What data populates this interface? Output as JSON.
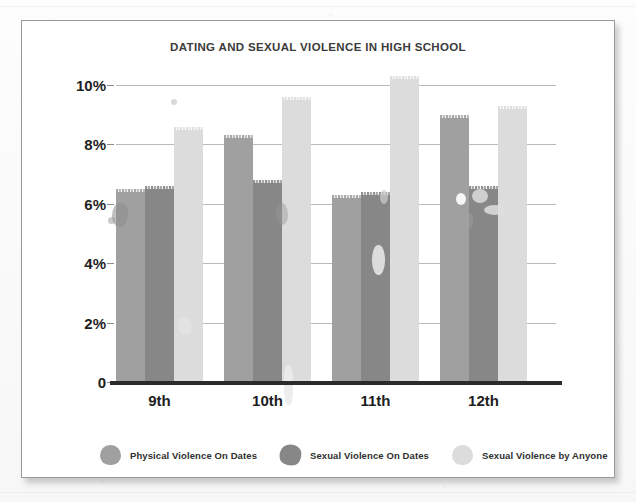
{
  "card": {
    "title": "DATING AND SEXUAL VIOLENCE IN HIGH SCHOOL"
  },
  "chart_data": {
    "type": "bar",
    "title": "DATING AND SEXUAL VIOLENCE IN HIGH SCHOOL",
    "xlabel": "",
    "ylabel": "",
    "categories": [
      "9th",
      "10th",
      "11th",
      "12th"
    ],
    "series": [
      {
        "name": "Physical Violence On Dates",
        "color": "#a0a0a0",
        "values": [
          6.4,
          8.2,
          6.2,
          8.9
        ]
      },
      {
        "name": "Sexual Violence On Dates",
        "color": "#878787",
        "values": [
          6.5,
          6.7,
          6.3,
          6.5
        ]
      },
      {
        "name": "Sexual Violence by Anyone",
        "color": "#dcdcdc",
        "values": [
          8.5,
          9.5,
          10.2,
          9.2
        ]
      }
    ],
    "ylim": [
      0,
      10
    ],
    "ytick_values": [
      0,
      2,
      4,
      6,
      8,
      10
    ],
    "ytick_labels": [
      "0",
      "2%",
      "4%",
      "6%",
      "8%",
      "10%"
    ],
    "grid": true,
    "legend_position": "bottom",
    "bar_mode": "grouped"
  },
  "legend": {
    "items": [
      {
        "label": "Physical Violence On Dates",
        "color": "#a0a0a0"
      },
      {
        "label": "Sexual Violence On Dates",
        "color": "#878787"
      },
      {
        "label": "Sexual Violence by Anyone",
        "color": "#dcdcdc"
      }
    ]
  }
}
